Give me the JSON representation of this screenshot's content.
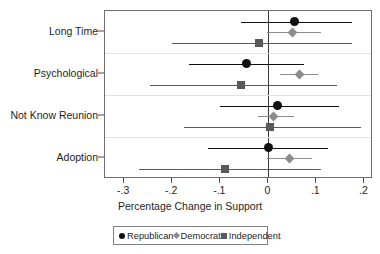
{
  "chart_data": {
    "type": "scatter",
    "title": "",
    "xlabel": "Percentage Change in Support",
    "ylabel": "",
    "xlim": [
      -0.34,
      0.218
    ],
    "xticks": [
      -0.3,
      -0.2,
      -0.1,
      0,
      0.1,
      0.2
    ],
    "xticklabels": [
      "-.3",
      "-.2",
      "-.1",
      "0",
      ".1",
      ".2"
    ],
    "categories": [
      "Long Time",
      "Psychological",
      "Not Know Reunion",
      "Adoption"
    ],
    "grid": false,
    "zero_reference_line": 0,
    "legend_position": "bottom",
    "orientation": "horizontal",
    "series": [
      {
        "name": "Republican",
        "marker": "circle",
        "color": "#111111",
        "points": [
          {
            "category": "Long Time",
            "estimate": 0.054,
            "ci_low": -0.056,
            "ci_high": 0.174
          },
          {
            "category": "Psychological",
            "estimate": -0.046,
            "ci_low": -0.166,
            "ci_high": 0.074
          },
          {
            "category": "Not Know Reunion",
            "estimate": 0.02,
            "ci_low": -0.1,
            "ci_high": 0.148
          },
          {
            "category": "Adoption",
            "estimate": 0.0,
            "ci_low": -0.126,
            "ci_high": 0.124
          }
        ]
      },
      {
        "name": "Democrat",
        "marker": "diamond",
        "color": "#8c8c8c",
        "points": [
          {
            "category": "Long Time",
            "estimate": 0.05,
            "ci_low": -0.002,
            "ci_high": 0.11
          },
          {
            "category": "Psychological",
            "estimate": 0.064,
            "ci_low": 0.024,
            "ci_high": 0.104
          },
          {
            "category": "Not Know Reunion",
            "estimate": 0.01,
            "ci_low": -0.022,
            "ci_high": 0.054
          },
          {
            "category": "Adoption",
            "estimate": 0.044,
            "ci_low": -0.002,
            "ci_high": 0.09
          }
        ]
      },
      {
        "name": "Independent",
        "marker": "square",
        "color": "#5a5a5a",
        "points": [
          {
            "category": "Long Time",
            "estimate": -0.02,
            "ci_low": -0.2,
            "ci_high": 0.174
          },
          {
            "category": "Psychological",
            "estimate": -0.056,
            "ci_low": -0.246,
            "ci_high": 0.144
          },
          {
            "category": "Not Know Reunion",
            "estimate": 0.004,
            "ci_low": -0.176,
            "ci_high": 0.194
          },
          {
            "category": "Adoption",
            "estimate": -0.09,
            "ci_low": -0.27,
            "ci_high": 0.11
          }
        ]
      }
    ],
    "legend": [
      {
        "label": "Republican",
        "marker": "circle"
      },
      {
        "label": "Democrat",
        "marker": "diamond"
      },
      {
        "label": "Independent",
        "marker": "square"
      }
    ]
  }
}
